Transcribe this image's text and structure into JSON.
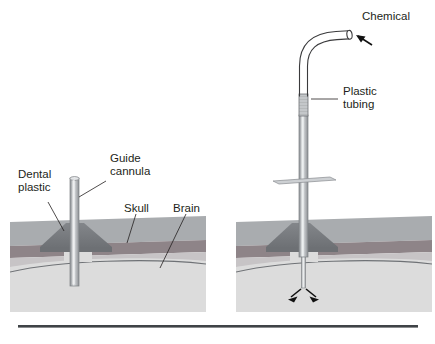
{
  "figure": {
    "title_partial": "",
    "caption_rule_color": "#3f4347"
  },
  "colors": {
    "scalp": "#a7aaad",
    "scalp_dark": "#9b9ea2",
    "skull": "#8d8388",
    "skull_light": "#c9c5c7",
    "brain": "#dcdcdc",
    "brain_edge": "#6f7276",
    "dental_plastic": "#7c7f83",
    "cannula_body": "#b9bcbf",
    "cannula_highlight": "#e8eaec",
    "cannula_edge": "#7d8084",
    "tubing_line": "#3a3a3c",
    "arrow": "#111111",
    "text": "#231f20"
  },
  "left_panel": {
    "name": "guide-cannula-implant",
    "labels": [
      {
        "id": "dental-plastic",
        "line1": "Dental",
        "line2": "plastic"
      },
      {
        "id": "guide-cannula",
        "line1": "Guide",
        "line2": "cannula"
      },
      {
        "id": "skull",
        "line1": "Skull",
        "line2": ""
      },
      {
        "id": "brain",
        "line1": "Brain",
        "line2": ""
      }
    ]
  },
  "right_panel": {
    "name": "injector-infusion",
    "labels": [
      {
        "id": "chemical",
        "line1": "Chemical",
        "line2": ""
      },
      {
        "id": "plastic-tubing",
        "line1": "Plastic",
        "line2": "tubing"
      }
    ]
  }
}
